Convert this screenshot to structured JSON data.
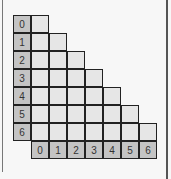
{
  "diagram": {
    "type": "lower-triangular-matrix",
    "size": 7,
    "row_labels": [
      "0",
      "1",
      "2",
      "3",
      "4",
      "5",
      "6"
    ],
    "col_labels": [
      "0",
      "1",
      "2",
      "3",
      "4",
      "5",
      "6"
    ],
    "colors": {
      "label_bg": "#c4c4c4",
      "cell_bg": "#e6e6e6",
      "border": "#222222"
    }
  }
}
